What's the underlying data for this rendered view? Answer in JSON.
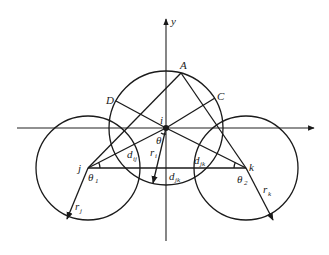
{
  "figure": {
    "axes": {
      "x_label": "",
      "y_label": "y"
    },
    "points": {
      "A": "A",
      "B_C": "C",
      "D": "D",
      "i": "i",
      "j": "j",
      "k": "k"
    },
    "angles": {
      "theta": "θ",
      "theta1": "θ",
      "theta1_sub": "1",
      "theta2": "θ",
      "theta2_sub": "2"
    },
    "distances": {
      "d_ij": "d",
      "d_ij_sub": "ij",
      "d_jk": "d",
      "d_jk_sub": "jk",
      "d_ik": "d",
      "d_ik_sub": "jk"
    },
    "radii": {
      "r_i": "r",
      "r_i_sub": "i",
      "r_j": "r",
      "r_j_sub": "j",
      "r_k": "r",
      "r_k_sub": "k"
    },
    "colors": {
      "line": "#1a1a1a",
      "background": "#ffffff"
    }
  }
}
